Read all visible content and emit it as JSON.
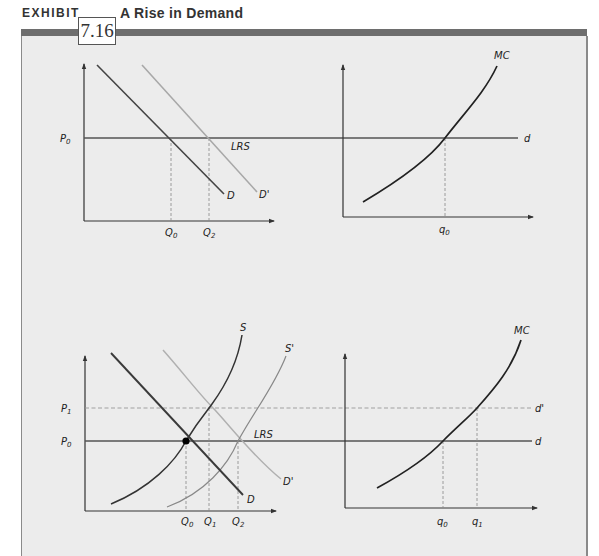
{
  "header": {
    "exhibit_word": "EXHIBIT",
    "exhibit_number": "7.16",
    "title": "A Rise in Demand"
  },
  "colors": {
    "panel_bg": "#ececec",
    "bar": "#6e6e6e",
    "dark_curve": "#2a2a2a",
    "light_curve": "#a8a8a8",
    "axis": "#333333",
    "dashed": "#8a8a8a"
  },
  "top_left": {
    "p0": "P",
    "p0_sub": "0",
    "lrs": "LRS",
    "d": "D",
    "d_prime": "D'",
    "q0": "Q",
    "q0_sub": "0",
    "q2": "Q",
    "q2_sub": "2"
  },
  "top_right": {
    "mc": "MC",
    "d": "d",
    "q0": "q",
    "q0_sub": "0"
  },
  "bottom_left": {
    "p1": "P",
    "p1_sub": "1",
    "p0": "P",
    "p0_sub": "0",
    "s": "S",
    "s_prime": "S'",
    "lrs": "LRS",
    "d": "D",
    "d_prime": "D'",
    "q0": "Q",
    "q0_sub": "0",
    "q1": "Q",
    "q1_sub": "1",
    "q2": "Q",
    "q2_sub": "2"
  },
  "bottom_right": {
    "mc": "MC",
    "d_prime": "d'",
    "d": "d",
    "q0": "q",
    "q0_sub": "0",
    "q1": "q",
    "q1_sub": "1"
  }
}
